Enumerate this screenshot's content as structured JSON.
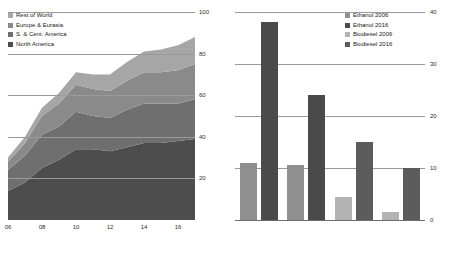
{
  "colors": {
    "north_america": "#4d4d4d",
    "s_cent_america": "#6f6f6f",
    "europe_eurasia": "#8a8a8a",
    "rest_of_world": "#a6a6a6",
    "ethanol_2006": "#8f8f8f",
    "ethanol_2016": "#4a4a4a",
    "biodiesel_2006": "#b3b3b3",
    "biodiesel_2016": "#5c5c5c",
    "gridline": "#9a9a9a",
    "axis": "#6e6e6e",
    "text": "#2b2b2b",
    "background": "#ffffff"
  },
  "chart_data": [
    {
      "type": "area",
      "id": "biofuels-production-area",
      "title": "",
      "xlabel": "",
      "ylabel": "",
      "stacked": true,
      "grid": true,
      "legend_position": "top-left",
      "xlim": [
        2006,
        2017
      ],
      "ylim": [
        0,
        100
      ],
      "yticks": [
        20,
        40,
        60,
        80,
        100
      ],
      "xticks": [
        2006,
        2008,
        2010,
        2012,
        2014,
        2016
      ],
      "xtick_labels": [
        "06",
        "08",
        "10",
        "12",
        "14",
        "16"
      ],
      "x": [
        2006,
        2007,
        2008,
        2009,
        2010,
        2011,
        2012,
        2013,
        2014,
        2015,
        2016,
        2017
      ],
      "series": [
        {
          "name": "North America",
          "color_key": "north_america",
          "values": [
            14,
            18,
            25,
            29,
            34,
            34,
            33,
            35,
            37,
            37,
            38,
            39
          ]
        },
        {
          "name": "S. & Cent. America",
          "color_key": "s_cent_america",
          "values": [
            10,
            13,
            16,
            16,
            18,
            16,
            16,
            18,
            19,
            19,
            18,
            19
          ]
        },
        {
          "name": "Europe & Eurasia",
          "color_key": "europe_eurasia",
          "values": [
            4,
            6,
            9,
            11,
            13,
            13,
            13,
            14,
            15,
            15,
            16,
            17
          ]
        },
        {
          "name": "Rest of World",
          "color_key": "rest_of_world",
          "values": [
            2,
            3,
            4,
            5,
            6,
            7,
            8,
            9,
            10,
            11,
            12,
            13
          ]
        }
      ],
      "legend": [
        {
          "label": "Rest of World",
          "color_key": "rest_of_world"
        },
        {
          "label": "Europe & Eurasia",
          "color_key": "europe_eurasia"
        },
        {
          "label": "S. & Cent. America",
          "color_key": "s_cent_america"
        },
        {
          "label": "North America",
          "color_key": "north_america"
        }
      ]
    },
    {
      "type": "bar",
      "id": "biofuels-by-region-bar",
      "title": "",
      "xlabel": "",
      "ylabel": "",
      "grid": true,
      "legend_position": "top-right",
      "ylim": [
        0,
        40
      ],
      "yticks": [
        0,
        10,
        20,
        30,
        40
      ],
      "categories": [
        "North America",
        "S. & Cent. America",
        "Europe & Eurasia",
        "Rest of World"
      ],
      "series": [
        {
          "name": "Ethanol 2006",
          "color_key": "ethanol_2006",
          "values": [
            11,
            10.5,
            4.5,
            0
          ]
        },
        {
          "name": "Ethanol 2016",
          "color_key": "ethanol_2016",
          "values": [
            38,
            24,
            0,
            0
          ]
        },
        {
          "name": "Biodiesel 2006",
          "color_key": "biodiesel_2006",
          "values": [
            0,
            0,
            15,
            10
          ]
        },
        {
          "name": "Biodiesel 2016",
          "color_key": "biodiesel_2016",
          "values": [
            0,
            0,
            4,
            6
          ]
        }
      ],
      "legend": [
        {
          "label": "Ethanol 2006",
          "color_key": "ethanol_2006"
        },
        {
          "label": "Ethanol 2016",
          "color_key": "ethanol_2016"
        },
        {
          "label": "Biodiesel 2006",
          "color_key": "biodiesel_2006"
        },
        {
          "label": "Biodiesel 2016",
          "color_key": "biodiesel_2016"
        }
      ],
      "bar_layout": [
        {
          "category": "North America",
          "bars": [
            {
              "series": "Ethanol 2006",
              "value": 11
            },
            {
              "series": "Ethanol 2016",
              "value": 38
            }
          ]
        },
        {
          "category": "S. & Cent. America",
          "bars": [
            {
              "series": "Ethanol 2006",
              "value": 10.5
            },
            {
              "series": "Ethanol 2016",
              "value": 24
            }
          ]
        },
        {
          "category": "Europe & Eurasia",
          "bars": [
            {
              "series": "Biodiesel 2006",
              "value": 4.5
            },
            {
              "series": "Biodiesel 2016",
              "value": 15
            }
          ]
        },
        {
          "category": "Rest of World",
          "bars": [
            {
              "series": "Biodiesel 2006",
              "value": 1.5
            },
            {
              "series": "Biodiesel 2016",
              "value": 10
            }
          ]
        }
      ]
    }
  ]
}
